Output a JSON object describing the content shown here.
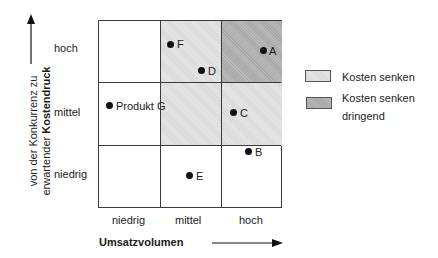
{
  "diagram": {
    "y_axis": {
      "label_line1": "von der Konkurrenz zu",
      "label_line2_prefix": "erwartender ",
      "label_line2_bold": "Kostendruck",
      "ticks": [
        "hoch",
        "mittel",
        "niedrig"
      ]
    },
    "x_axis": {
      "label": "Umsatzvolumen",
      "ticks": [
        "niedrig",
        "mittel",
        "hoch"
      ]
    },
    "cells": [
      {
        "row": "hoch",
        "col": "niedrig",
        "shade": "none"
      },
      {
        "row": "hoch",
        "col": "mittel",
        "shade": "Kosten senken"
      },
      {
        "row": "hoch",
        "col": "hoch",
        "shade": "Kosten senken dringend"
      },
      {
        "row": "mittel",
        "col": "niedrig",
        "shade": "none"
      },
      {
        "row": "mittel",
        "col": "mittel",
        "shade": "Kosten senken"
      },
      {
        "row": "mittel",
        "col": "hoch",
        "shade": "Kosten senken"
      },
      {
        "row": "niedrig",
        "col": "niedrig",
        "shade": "none"
      },
      {
        "row": "niedrig",
        "col": "mittel",
        "shade": "none"
      },
      {
        "row": "niedrig",
        "col": "hoch",
        "shade": "none"
      }
    ],
    "points": [
      {
        "label": "F"
      },
      {
        "label": "D"
      },
      {
        "label": "A"
      },
      {
        "label": "Produkt G"
      },
      {
        "label": "C"
      },
      {
        "label": "B"
      },
      {
        "label": "E"
      }
    ],
    "legend": [
      {
        "label": "Kosten senken",
        "color": "#e0e0e0"
      },
      {
        "label_line1": "Kosten senken",
        "label_line2": "dringend",
        "color": "#b0b0b0"
      }
    ]
  }
}
